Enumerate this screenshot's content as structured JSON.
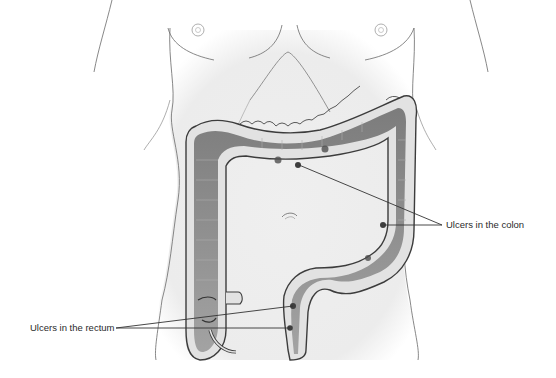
{
  "figure": {
    "labels": {
      "colon": "Ulcers in the colon",
      "rectum": "Ulcers in the rectum"
    },
    "colors": {
      "background": "#ffffff",
      "torso_fill": "#eeeeee",
      "outline": "#555555",
      "colon_wall": "#e4e4e4",
      "colon_lumen": "#8f8f8f",
      "ulcer": "#4a4a4a",
      "leader_line": "#333333"
    }
  }
}
